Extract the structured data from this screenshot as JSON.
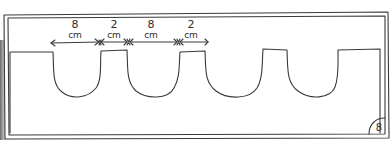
{
  "diagram": {
    "dimensions": [
      {
        "value": "8",
        "unit": "cm"
      },
      {
        "value": "2",
        "unit": "cm"
      },
      {
        "value": "8",
        "unit": "cm"
      },
      {
        "value": "2",
        "unit": "cm"
      }
    ],
    "notch_count": 4,
    "page_badge": "8",
    "colors": {
      "ink": "#3a3a3a",
      "paper": "#ffffff"
    }
  }
}
